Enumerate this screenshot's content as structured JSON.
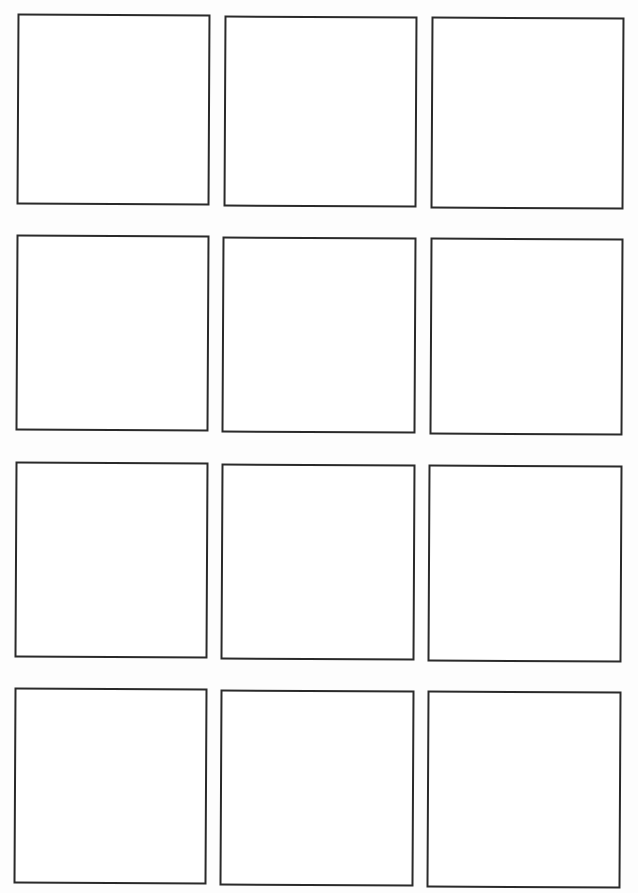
{
  "document": {
    "type": "blank grid worksheet",
    "grid": {
      "rows": 4,
      "columns": 3,
      "box_count": 12
    },
    "boxes": [
      {
        "row": 1,
        "col": 1,
        "content": ""
      },
      {
        "row": 1,
        "col": 2,
        "content": ""
      },
      {
        "row": 1,
        "col": 3,
        "content": ""
      },
      {
        "row": 2,
        "col": 1,
        "content": ""
      },
      {
        "row": 2,
        "col": 2,
        "content": ""
      },
      {
        "row": 2,
        "col": 3,
        "content": ""
      },
      {
        "row": 3,
        "col": 1,
        "content": ""
      },
      {
        "row": 3,
        "col": 2,
        "content": ""
      },
      {
        "row": 3,
        "col": 3,
        "content": ""
      },
      {
        "row": 4,
        "col": 1,
        "content": ""
      },
      {
        "row": 4,
        "col": 2,
        "content": ""
      },
      {
        "row": 4,
        "col": 3,
        "content": ""
      }
    ],
    "colors": {
      "border": "#2a2a2a",
      "paper": "#fdfdfd"
    }
  }
}
